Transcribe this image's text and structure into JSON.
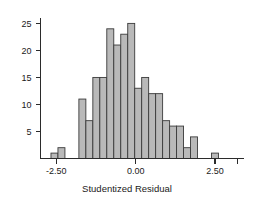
{
  "chart_data": {
    "type": "bar",
    "title": "",
    "subtitle": "",
    "xlabel": "Studentized Residual",
    "ylabel": "",
    "xlim": [
      -3.0,
      3.4
    ],
    "ylim": [
      0,
      26
    ],
    "grid": false,
    "legend": null,
    "bin_width": 0.22,
    "x_tick_labels": [
      "-2.50",
      "0.00",
      "2.50"
    ],
    "x_tick_values": [
      -2.5,
      0.0,
      2.5
    ],
    "x_extra_tick_values": [
      3.2
    ],
    "y_tick_labels": [
      "5",
      "10",
      "15",
      "20",
      "25"
    ],
    "y_tick_values": [
      5,
      10,
      15,
      20,
      25
    ],
    "bar_fill": "#b9b9b9",
    "bar_stroke": "#3a3a3a",
    "axis_color": "#2b2b2b",
    "bins": [
      {
        "x": -2.56,
        "value": 1
      },
      {
        "x": -2.34,
        "value": 2
      },
      {
        "x": -2.12,
        "value": 0
      },
      {
        "x": -1.9,
        "value": 0
      },
      {
        "x": -1.68,
        "value": 11
      },
      {
        "x": -1.46,
        "value": 7
      },
      {
        "x": -1.24,
        "value": 15
      },
      {
        "x": -1.02,
        "value": 15
      },
      {
        "x": -0.8,
        "value": 24
      },
      {
        "x": -0.58,
        "value": 21
      },
      {
        "x": -0.36,
        "value": 23
      },
      {
        "x": -0.14,
        "value": 25
      },
      {
        "x": 0.08,
        "value": 13
      },
      {
        "x": 0.3,
        "value": 15
      },
      {
        "x": 0.52,
        "value": 12
      },
      {
        "x": 0.74,
        "value": 12
      },
      {
        "x": 0.96,
        "value": 7
      },
      {
        "x": 1.18,
        "value": 6
      },
      {
        "x": 1.4,
        "value": 6
      },
      {
        "x": 1.62,
        "value": 2
      },
      {
        "x": 1.84,
        "value": 4
      },
      {
        "x": 2.06,
        "value": 0
      },
      {
        "x": 2.28,
        "value": 0
      },
      {
        "x": 2.5,
        "value": 1
      }
    ],
    "categories": [
      "-2.56",
      "-2.34",
      "-2.12",
      "-1.90",
      "-1.68",
      "-1.46",
      "-1.24",
      "-1.02",
      "-0.80",
      "-0.58",
      "-0.36",
      "-0.14",
      "0.08",
      "0.30",
      "0.52",
      "0.74",
      "0.96",
      "1.18",
      "1.40",
      "1.62",
      "1.84",
      "2.06",
      "2.28",
      "2.50"
    ],
    "values": [
      1,
      2,
      0,
      0,
      11,
      7,
      15,
      15,
      24,
      21,
      23,
      25,
      13,
      15,
      12,
      12,
      7,
      6,
      6,
      2,
      4,
      0,
      0,
      1
    ]
  }
}
